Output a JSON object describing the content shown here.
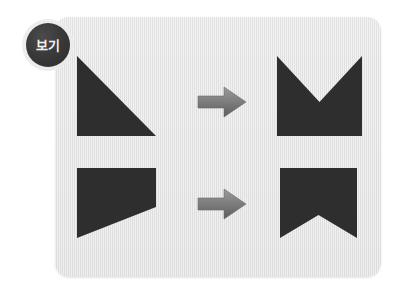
{
  "page": {
    "background_color": "#ffffff",
    "width": 401,
    "height": 291
  },
  "panel": {
    "name": "worksheet-panel",
    "background_color": "#e1e1e1",
    "corner_radius": 14,
    "x": 55,
    "y": 17,
    "width": 326,
    "height": 260
  },
  "badge": {
    "label": "보기",
    "background_color": "#333333",
    "text_color": "#f2f2f2",
    "ring_color": "#ececec",
    "shape": "circle"
  },
  "palette": {
    "shape_fill": "#2e2e2e",
    "arrow_fill_light": "#8e8e8e",
    "arrow_fill_dark": "#5f5f5f"
  },
  "rows": [
    {
      "name": "row-top",
      "source": {
        "name": "right-triangle-shape",
        "label": "right triangle",
        "fill": "#2e2e2e",
        "x": 77,
        "y": 56,
        "width": 79,
        "height": 80,
        "points": "0,0 0,80 79,80"
      },
      "arrow": {
        "name": "transform-arrow",
        "label": "arrow-right-icon",
        "direction": "right",
        "x": 198,
        "y": 87,
        "width": 48,
        "height": 30
      },
      "result": {
        "name": "m-notch-shape",
        "label": "square with top V notch",
        "fill": "#2e2e2e",
        "x": 277,
        "y": 56,
        "width": 85,
        "height": 80,
        "points": "0,0 0,80 85,80 85,0 42.5,46"
      }
    },
    {
      "name": "row-bottom",
      "source": {
        "name": "flag-trapezoid-shape",
        "label": "trapezoid flag",
        "fill": "#2e2e2e",
        "x": 77,
        "y": 168,
        "width": 79,
        "height": 70,
        "points": "0,0 79,0 79,39 0,70"
      },
      "arrow": {
        "name": "transform-arrow",
        "label": "arrow-right-icon",
        "direction": "right",
        "x": 198,
        "y": 189,
        "width": 48,
        "height": 30
      },
      "result": {
        "name": "ribbon-notch-shape",
        "label": "square with bottom V notch",
        "fill": "#2e2e2e",
        "x": 280,
        "y": 168,
        "width": 77,
        "height": 70,
        "points": "0,0 77,0 77,70 38.5,47 0,70"
      }
    }
  ]
}
